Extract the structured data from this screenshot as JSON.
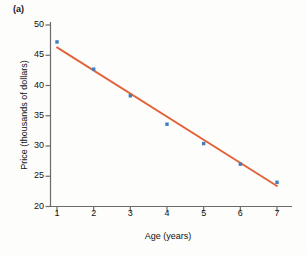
{
  "figure": {
    "panel_label": "(a)",
    "background_color": "#fdfdfc"
  },
  "chart_data": {
    "type": "scatter",
    "title": "",
    "subtitle": "",
    "xlabel": "Age (years)",
    "ylabel": "Price (thousands of dollars)",
    "x": [
      1,
      2,
      3,
      4,
      5,
      6,
      7
    ],
    "values": [
      47.2,
      42.7,
      38.3,
      33.6,
      30.4,
      27.0,
      24.0
    ],
    "series": [
      {
        "name": "Price observations",
        "type": "scatter",
        "marker_color": "#3d7fbf",
        "x": [
          1,
          2,
          3,
          4,
          5,
          6,
          7
        ],
        "values": [
          47.2,
          42.7,
          38.3,
          33.6,
          30.4,
          27.0,
          24.0
        ]
      },
      {
        "name": "Least-squares regression line",
        "type": "line",
        "line_color": "#e2633a",
        "x": [
          1,
          7
        ],
        "values": [
          46.3,
          23.4
        ]
      }
    ],
    "xlim": [
      0.6,
      7.4
    ],
    "ylim": [
      20,
      50
    ],
    "xticks": [
      1,
      2,
      3,
      4,
      5,
      6,
      7
    ],
    "xtick_labels": [
      "1",
      "2",
      "3",
      "4",
      "5",
      "6",
      "7"
    ],
    "yticks": [
      20,
      25,
      30,
      35,
      40,
      45,
      50
    ],
    "ytick_labels": [
      "20",
      "25",
      "30",
      "35",
      "40",
      "45",
      "50"
    ],
    "grid": false,
    "legend": false,
    "legend_position": "none",
    "annotations": [
      "(a)"
    ],
    "axis_color": "#6b6b6b"
  }
}
